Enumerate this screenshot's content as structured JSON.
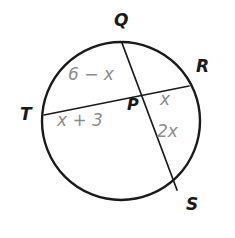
{
  "figure": {
    "background_color": "#ffffff",
    "stroke_color": "#1a1a1a",
    "label_color": "#1a1a1a",
    "measure_color": "#8c8c8c"
  },
  "circle": {
    "center_x": 121,
    "center_y": 121,
    "radius": 79
  },
  "points": {
    "Q": {
      "label": "Q",
      "x": 122,
      "y": 43
    },
    "R": {
      "label": "R",
      "x": 189,
      "y": 86
    },
    "T": {
      "label": "T",
      "x": 44,
      "y": 115
    },
    "S": {
      "label": "S",
      "x": 177,
      "y": 190
    },
    "P": {
      "label": "P",
      "x": 145,
      "y": 100
    }
  },
  "chords": [
    {
      "name": "QS",
      "from": "Q",
      "to": "S"
    },
    {
      "name": "TR",
      "from": "T",
      "to": "R"
    }
  ],
  "segment_labels": {
    "QP": "6 − x",
    "TP": "x + 3",
    "PR": "x",
    "PS": "2x"
  }
}
